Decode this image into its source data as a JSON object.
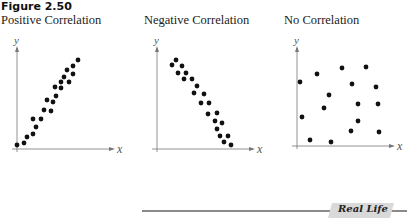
{
  "figure_label": "Figure 2.50",
  "footer": {
    "badge_text": "Real Life"
  },
  "chart_data": [
    {
      "type": "scatter",
      "title": "Positive Correlation",
      "xlabel": "x",
      "ylabel": "y",
      "grid": false,
      "axis_origin_px": [
        17,
        149
      ],
      "points_px": [
        [
          17,
          145
        ],
        [
          24,
          143
        ],
        [
          27,
          137
        ],
        [
          33,
          134
        ],
        [
          36,
          127
        ],
        [
          33,
          119
        ],
        [
          41,
          119
        ],
        [
          44,
          110
        ],
        [
          51,
          111
        ],
        [
          47,
          100
        ],
        [
          53,
          102
        ],
        [
          56,
          96
        ],
        [
          55,
          87
        ],
        [
          61,
          88
        ],
        [
          61,
          82
        ],
        [
          64,
          77
        ],
        [
          69,
          82
        ],
        [
          67,
          70
        ],
        [
          73,
          74
        ],
        [
          73,
          66
        ],
        [
          78,
          60
        ]
      ]
    },
    {
      "type": "scatter",
      "title": "Negative Correlation",
      "xlabel": "x",
      "ylabel": "y",
      "grid": false,
      "axis_origin_px": [
        157,
        149
      ],
      "points_px": [
        [
          176,
          60
        ],
        [
          172,
          65
        ],
        [
          182,
          66
        ],
        [
          178,
          73
        ],
        [
          186,
          73
        ],
        [
          184,
          79
        ],
        [
          192,
          79
        ],
        [
          197,
          86
        ],
        [
          194,
          93
        ],
        [
          204,
          94
        ],
        [
          201,
          103
        ],
        [
          209,
          103
        ],
        [
          208,
          114
        ],
        [
          217,
          113
        ],
        [
          215,
          121
        ],
        [
          222,
          123
        ],
        [
          217,
          129
        ],
        [
          220,
          136
        ],
        [
          228,
          136
        ],
        [
          224,
          142
        ],
        [
          231,
          145
        ]
      ]
    },
    {
      "type": "scatter",
      "title": "No Correlation",
      "xlabel": "x",
      "ylabel": "y",
      "grid": false,
      "axis_origin_px": [
        297,
        146
      ],
      "points_px": [
        [
          300,
          82
        ],
        [
          317,
          74
        ],
        [
          342,
          68
        ],
        [
          366,
          67
        ],
        [
          352,
          84
        ],
        [
          376,
          87
        ],
        [
          329,
          95
        ],
        [
          358,
          104
        ],
        [
          378,
          104
        ],
        [
          324,
          108
        ],
        [
          302,
          117
        ],
        [
          358,
          121
        ],
        [
          351,
          131
        ],
        [
          379,
          132
        ],
        [
          310,
          140
        ],
        [
          331,
          142
        ]
      ]
    }
  ]
}
